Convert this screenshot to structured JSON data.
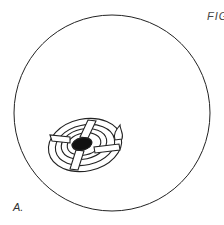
{
  "figure": {
    "title_fragment": "FIG",
    "panel_label": "A.",
    "colors": {
      "line": "#222222",
      "fill_dark": "#111111",
      "background": "#ffffff"
    }
  }
}
